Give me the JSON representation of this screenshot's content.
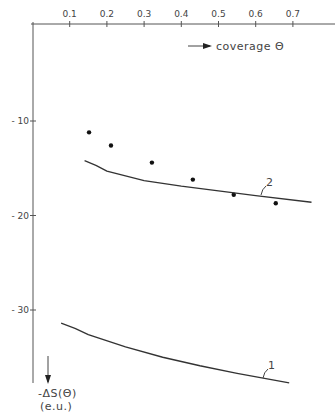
{
  "chart_data": {
    "type": "scatter",
    "title": "",
    "xlabel": "coverage Θ",
    "ylabel": "-ΔS(Θ)",
    "ylabel_unit": "(e.u.)",
    "x_ticks": [
      "0.1",
      "0.2",
      "0.3",
      "0.4",
      "0.5",
      "0.6",
      "0.7"
    ],
    "y_ticks": [
      "-10",
      "-20",
      "-30"
    ],
    "xlim": [
      0,
      0.8
    ],
    "ylim": [
      -39,
      -3
    ],
    "grid": false,
    "series": [
      {
        "name": "experimental",
        "kind": "points",
        "x": [
          0.152,
          0.211,
          0.321,
          0.431,
          0.541,
          0.654
        ],
        "y": [
          -11.2,
          -12.6,
          -14.4,
          -16.2,
          -17.8,
          -18.7
        ]
      },
      {
        "name": "2",
        "kind": "line",
        "x": [
          0.14,
          0.2,
          0.3,
          0.4,
          0.5,
          0.6,
          0.75
        ],
        "y": [
          -14.2,
          -15.3,
          -16.3,
          -16.9,
          -17.4,
          -17.9,
          -18.6
        ]
      },
      {
        "name": "1",
        "kind": "line",
        "x": [
          0.077,
          0.15,
          0.25,
          0.35,
          0.45,
          0.55,
          0.69
        ],
        "y": [
          -31.4,
          -32.6,
          -33.9,
          -35.0,
          -35.9,
          -36.7,
          -37.7
        ]
      }
    ],
    "annotations": [
      {
        "text": "2",
        "near": "curve 2 at Θ≈0.57"
      },
      {
        "text": "1",
        "near": "curve 1 at Θ≈0.62"
      }
    ]
  }
}
